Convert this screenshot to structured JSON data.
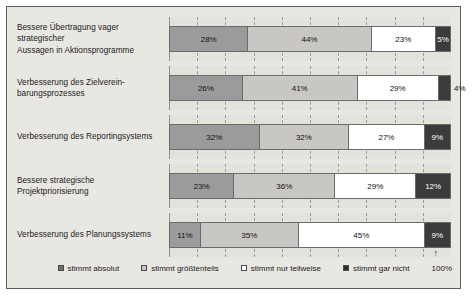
{
  "chart_data": {
    "type": "bar",
    "subtype": "100% stacked horizontal bar",
    "title": "",
    "xlabel": "",
    "ylabel": "",
    "xlim": [
      0,
      100
    ],
    "grid": true,
    "grid_style": "dashed vertical",
    "legend_position": "bottom",
    "axis_end_label": "100%",
    "axis_end_marker": "↑",
    "categories": [
      "Bessere Übertragung vager strategischer Aussagen in Aktionsprogramme",
      "Verbesserung des Zielverein-barungsprozesses",
      "Verbesserung des Reportingsystems",
      "Bessere strategische Projektpriorisierung",
      "Verbesserung des Planungssystems"
    ],
    "series": [
      {
        "name": "stimmt absolut",
        "color": "#9b9b9b",
        "values": [
          28,
          26,
          32,
          23,
          11
        ]
      },
      {
        "name": "stimmt größtenteils",
        "color": "#c9c7c4",
        "values": [
          44,
          41,
          32,
          36,
          35
        ]
      },
      {
        "name": "stimmt nur teilweise",
        "color": "#ffffff",
        "values": [
          23,
          29,
          27,
          29,
          45
        ]
      },
      {
        "name": "stimmt gar nicht",
        "color": "#3b3b3b",
        "values": [
          5,
          4,
          9,
          12,
          9
        ]
      }
    ],
    "value_labels": [
      [
        "28%",
        "44%",
        "23%",
        "5%"
      ],
      [
        "26%",
        "41%",
        "29%",
        "4%"
      ],
      [
        "32%",
        "32%",
        "27%",
        "9%"
      ],
      [
        "23%",
        "36%",
        "29%",
        "12%"
      ],
      [
        "11%",
        "35%",
        "45%",
        "9%"
      ]
    ],
    "label_outside": [
      [
        false,
        false,
        false,
        false
      ],
      [
        false,
        false,
        false,
        true
      ],
      [
        false,
        false,
        false,
        false
      ],
      [
        false,
        false,
        false,
        false
      ],
      [
        false,
        false,
        false,
        false
      ]
    ]
  },
  "legend": {
    "items": [
      {
        "label": "stimmt absolut"
      },
      {
        "label": "stimmt größtenteils"
      },
      {
        "label": "stimmt nur teilweise"
      },
      {
        "label": "stimmt gar nicht"
      }
    ]
  },
  "rows": [
    {
      "label_line1": "Bessere Übertragung vager strategischer",
      "label_line2": "Aussagen in Aktionsprogramme"
    },
    {
      "label_line1": "Verbesserung des Zielverein-",
      "label_line2": "barungsprozesses"
    },
    {
      "label_line1": "Verbesserung des Reportingsystems",
      "label_line2": ""
    },
    {
      "label_line1": "Bessere strategische Projektpriorisierung",
      "label_line2": ""
    },
    {
      "label_line1": "Verbesserung des Planungssystems",
      "label_line2": ""
    }
  ],
  "axis": {
    "end_label": "100%",
    "arrow": "↑"
  }
}
